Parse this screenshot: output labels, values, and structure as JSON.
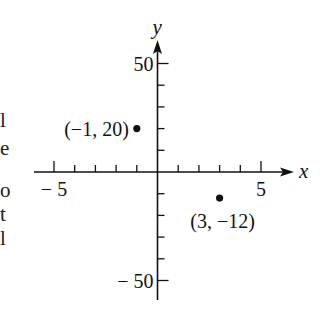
{
  "left_text_fragments": [
    "l",
    "e",
    "o",
    "t",
    "l"
  ],
  "chart_data": {
    "type": "scatter",
    "title": "",
    "xlabel": "x",
    "ylabel": "y",
    "xlim": [
      -6.5,
      6.5
    ],
    "ylim": [
      -60,
      60
    ],
    "x_ticks": [
      -5,
      -4,
      -3,
      -2,
      -1,
      0,
      1,
      2,
      3,
      4,
      5
    ],
    "y_ticks": [
      -50,
      -40,
      -30,
      -20,
      -10,
      0,
      10,
      20,
      30,
      40,
      50
    ],
    "x_tick_labels": [
      {
        "value": -5,
        "text": "− 5"
      },
      {
        "value": 5,
        "text": "5"
      }
    ],
    "y_tick_labels": [
      {
        "value": 50,
        "text": "50"
      },
      {
        "value": -50,
        "text": "− 50"
      }
    ],
    "grid": false,
    "points": [
      {
        "x": -1,
        "y": 20,
        "label": "(−1, 20)"
      },
      {
        "x": 3,
        "y": -12,
        "label": "(3, −12)"
      }
    ]
  }
}
